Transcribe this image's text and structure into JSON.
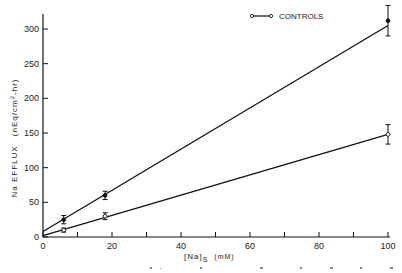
{
  "chart_data": {
    "type": "line",
    "title": "",
    "xlabel": "[Na]s (mM)",
    "xlabel_main": "[Na]",
    "xlabel_sub": "S",
    "xlabel_unit": "(mM)",
    "ylabel": "Na EFFLUX (nEq/cm2-hr)",
    "ylabel_main": "Na EFFLUX",
    "ylabel_unit": "(nEq/cm",
    "ylabel_sup": "2",
    "ylabel_unit_end": "-hr)",
    "xlim": [
      0,
      100
    ],
    "ylim": [
      0,
      320
    ],
    "xticks": [
      0,
      20,
      40,
      60,
      80,
      100
    ],
    "xticks_minor": [
      10,
      30,
      50,
      70,
      90
    ],
    "yticks": [
      0,
      50,
      100,
      150,
      200,
      250,
      300
    ],
    "x_tick_labels": [
      "0",
      "20",
      "40",
      "60",
      "80",
      "100"
    ],
    "y_tick_labels": [
      "0",
      "50",
      "100",
      "150",
      "200",
      "250",
      "300"
    ],
    "grid": false,
    "legend_position": "upper center-right",
    "series": [
      {
        "name": "Treated",
        "marker": "filled-circle",
        "x": [
          6,
          18,
          100
        ],
        "values": [
          25,
          60,
          312
        ],
        "error": [
          6,
          6,
          22
        ],
        "fit_line": {
          "x": [
            0,
            100
          ],
          "y": [
            8,
            305
          ]
        }
      },
      {
        "name": "CONTROLS",
        "marker": "open-circle",
        "x": [
          6,
          18,
          100
        ],
        "values": [
          10,
          30,
          148
        ],
        "error": [
          3,
          5,
          14
        ],
        "fit_line": {
          "x": [
            0,
            100
          ],
          "y": [
            2,
            148
          ]
        }
      }
    ]
  },
  "legend": {
    "label": "CONTROLS"
  }
}
